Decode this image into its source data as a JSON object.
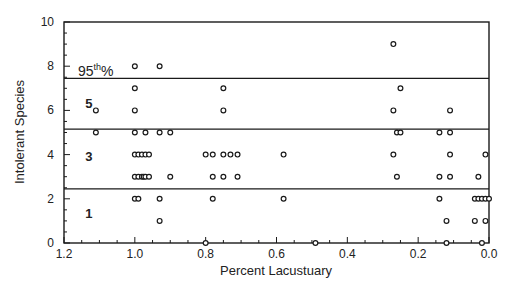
{
  "chart_data": {
    "type": "scatter",
    "title": "",
    "xlabel": "Percent Lacustuary",
    "ylabel": "Intolerant Species",
    "xlim": [
      1.2,
      0.0
    ],
    "ylim": [
      0,
      10
    ],
    "x_reversed": true,
    "x_ticks": [
      "1.2",
      "1.0",
      "0.8",
      "0.6",
      "0.4",
      "0.2",
      "0.0"
    ],
    "x_tick_values": [
      1.2,
      1.0,
      0.8,
      0.6,
      0.4,
      0.2,
      0.0
    ],
    "y_ticks": [
      "0",
      "2",
      "4",
      "6",
      "8",
      "10"
    ],
    "y_tick_values": [
      0,
      2,
      4,
      6,
      8,
      10
    ],
    "grid": false,
    "legend": null,
    "reference_lines": [
      {
        "y": 7.45,
        "label": "95th%"
      },
      {
        "y": 5.15,
        "label": ""
      },
      {
        "y": 2.45,
        "label": ""
      }
    ],
    "region_labels": [
      {
        "text": "5",
        "x": 1.14,
        "y": 6.3
      },
      {
        "text": "3",
        "x": 1.14,
        "y": 3.9
      },
      {
        "text": "1",
        "x": 1.14,
        "y": 1.3
      }
    ],
    "annotation": {
      "text_main": "95",
      "text_sup": "th",
      "text_tail": "%"
    },
    "series": [
      {
        "name": "sites",
        "points": [
          [
            0.27,
            9
          ],
          [
            1.0,
            8
          ],
          [
            0.93,
            8
          ],
          [
            1.0,
            7
          ],
          [
            0.75,
            7
          ],
          [
            0.25,
            7
          ],
          [
            1.11,
            6
          ],
          [
            1.0,
            6
          ],
          [
            0.75,
            6
          ],
          [
            0.27,
            6
          ],
          [
            0.11,
            6
          ],
          [
            1.11,
            5
          ],
          [
            1.0,
            5
          ],
          [
            0.97,
            5
          ],
          [
            0.93,
            5
          ],
          [
            0.9,
            5
          ],
          [
            0.26,
            5
          ],
          [
            0.25,
            5
          ],
          [
            0.14,
            5
          ],
          [
            0.11,
            5
          ],
          [
            1.0,
            4
          ],
          [
            0.99,
            4
          ],
          [
            0.98,
            4
          ],
          [
            0.97,
            4
          ],
          [
            0.96,
            4
          ],
          [
            0.8,
            4
          ],
          [
            0.78,
            4
          ],
          [
            0.75,
            4
          ],
          [
            0.73,
            4
          ],
          [
            0.71,
            4
          ],
          [
            0.58,
            4
          ],
          [
            0.27,
            4
          ],
          [
            0.11,
            4
          ],
          [
            0.01,
            4
          ],
          [
            1.0,
            3
          ],
          [
            0.99,
            3
          ],
          [
            0.98,
            3
          ],
          [
            0.975,
            3
          ],
          [
            0.97,
            3
          ],
          [
            0.96,
            3
          ],
          [
            0.9,
            3
          ],
          [
            0.78,
            3
          ],
          [
            0.75,
            3
          ],
          [
            0.71,
            3
          ],
          [
            0.26,
            3
          ],
          [
            0.14,
            3
          ],
          [
            0.11,
            3
          ],
          [
            0.03,
            3
          ],
          [
            1.0,
            2
          ],
          [
            0.99,
            2
          ],
          [
            0.93,
            2
          ],
          [
            0.78,
            2
          ],
          [
            0.58,
            2
          ],
          [
            0.14,
            2
          ],
          [
            0.04,
            2
          ],
          [
            0.03,
            2
          ],
          [
            0.02,
            2
          ],
          [
            0.01,
            2
          ],
          [
            0.0,
            2
          ],
          [
            0.93,
            1
          ],
          [
            0.12,
            1
          ],
          [
            0.04,
            1
          ],
          [
            0.01,
            1
          ],
          [
            0.8,
            0
          ],
          [
            0.49,
            0
          ],
          [
            0.12,
            0
          ],
          [
            0.02,
            0
          ]
        ]
      }
    ]
  }
}
